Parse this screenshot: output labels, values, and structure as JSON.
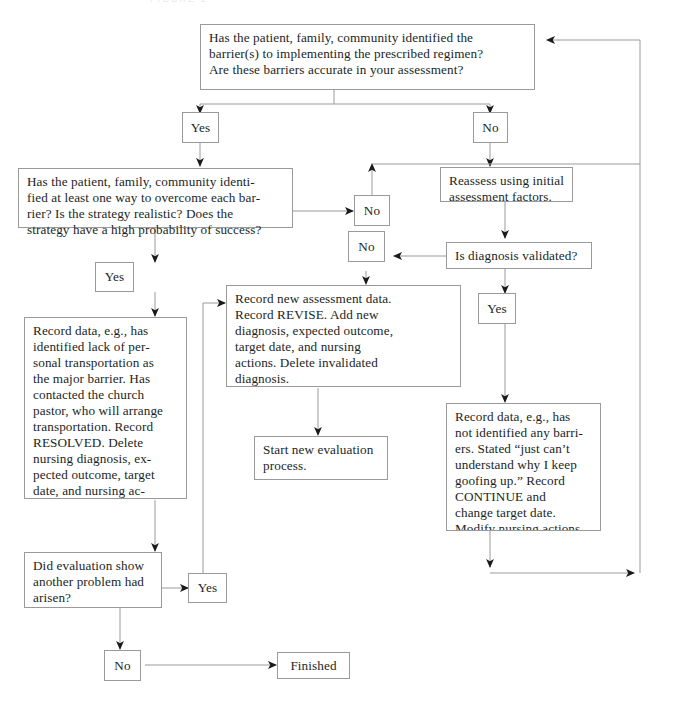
{
  "diagram": {
    "type": "flowchart",
    "title_fragment": "FIGURE 1",
    "nodes": [
      {
        "id": "q-barriers",
        "label": "Has the patient, family, community identified the\nbarrier(s) to implementing the prescribed regimen?\nAre these barriers accurate in your assessment?",
        "name": "node-question-barriers-identified"
      },
      {
        "id": "yes-1",
        "label": "Yes",
        "name": "node-yes-barriers-identified"
      },
      {
        "id": "no-1",
        "label": "No",
        "name": "node-no-barriers-identified"
      },
      {
        "id": "q-strategy",
        "label": "Has the patient, family, community identi-\nfied at least one way to overcome each bar-\nrier? Is the strategy realistic? Does the\nstrategy have a high probability of success?",
        "name": "node-question-strategy"
      },
      {
        "id": "no-2",
        "label": "No",
        "name": "node-no-strategy"
      },
      {
        "id": "reassess",
        "label": "Reassess using initial\nassessment factors.",
        "name": "node-reassess-initial-factors"
      },
      {
        "id": "no-3",
        "label": "No",
        "name": "node-no-diagnosis-validated"
      },
      {
        "id": "q-diagnosis",
        "label": "Is diagnosis validated?",
        "name": "node-question-diagnosis-validated"
      },
      {
        "id": "yes-2",
        "label": "Yes",
        "name": "node-yes-strategy"
      },
      {
        "id": "yes-3",
        "label": "Yes",
        "name": "node-yes-diagnosis-validated"
      },
      {
        "id": "record-revise",
        "label": "Record new assessment data.\nRecord REVISE. Add new\ndiagnosis, expected outcome,\ntarget date, and nursing\nactions. Delete invalidated\ndiagnosis.",
        "name": "node-record-revise"
      },
      {
        "id": "record-resolved",
        "label": "Record data, e.g., has\nidentified lack of per-\nsonal transportation as\nthe major barrier. Has\ncontacted the church\npastor, who will arrange\ntransportation. Record\nRESOLVED. Delete\nnursing diagnosis, ex-\npected outcome, target\ndate, and nursing ac-",
        "name": "node-record-resolved"
      },
      {
        "id": "record-continue",
        "label": "Record data, e.g., has\nnot identified any barri-\ners. Stated “just can’t\nunderstand why I keep\ngoofing up.” Record\nCONTINUE and\nchange target date.\nModify nursing actions\nas necessary.",
        "name": "node-record-continue"
      },
      {
        "id": "start-new",
        "label": "Start new evaluation\nprocess.",
        "name": "node-start-new-evaluation"
      },
      {
        "id": "q-another-problem",
        "label": "Did evaluation show\nanother problem had\narisen?",
        "name": "node-question-another-problem"
      },
      {
        "id": "yes-4",
        "label": "Yes",
        "name": "node-yes-another-problem"
      },
      {
        "id": "no-4",
        "label": "No",
        "name": "node-no-another-problem"
      },
      {
        "id": "finished",
        "label": "Finished",
        "name": "node-finished"
      }
    ],
    "colors": {
      "border": "#9a9a9a",
      "edge": "#8a8a8a",
      "arrow": "#1a1a1a",
      "text": "#211f1e",
      "background": "#ffffff"
    }
  }
}
